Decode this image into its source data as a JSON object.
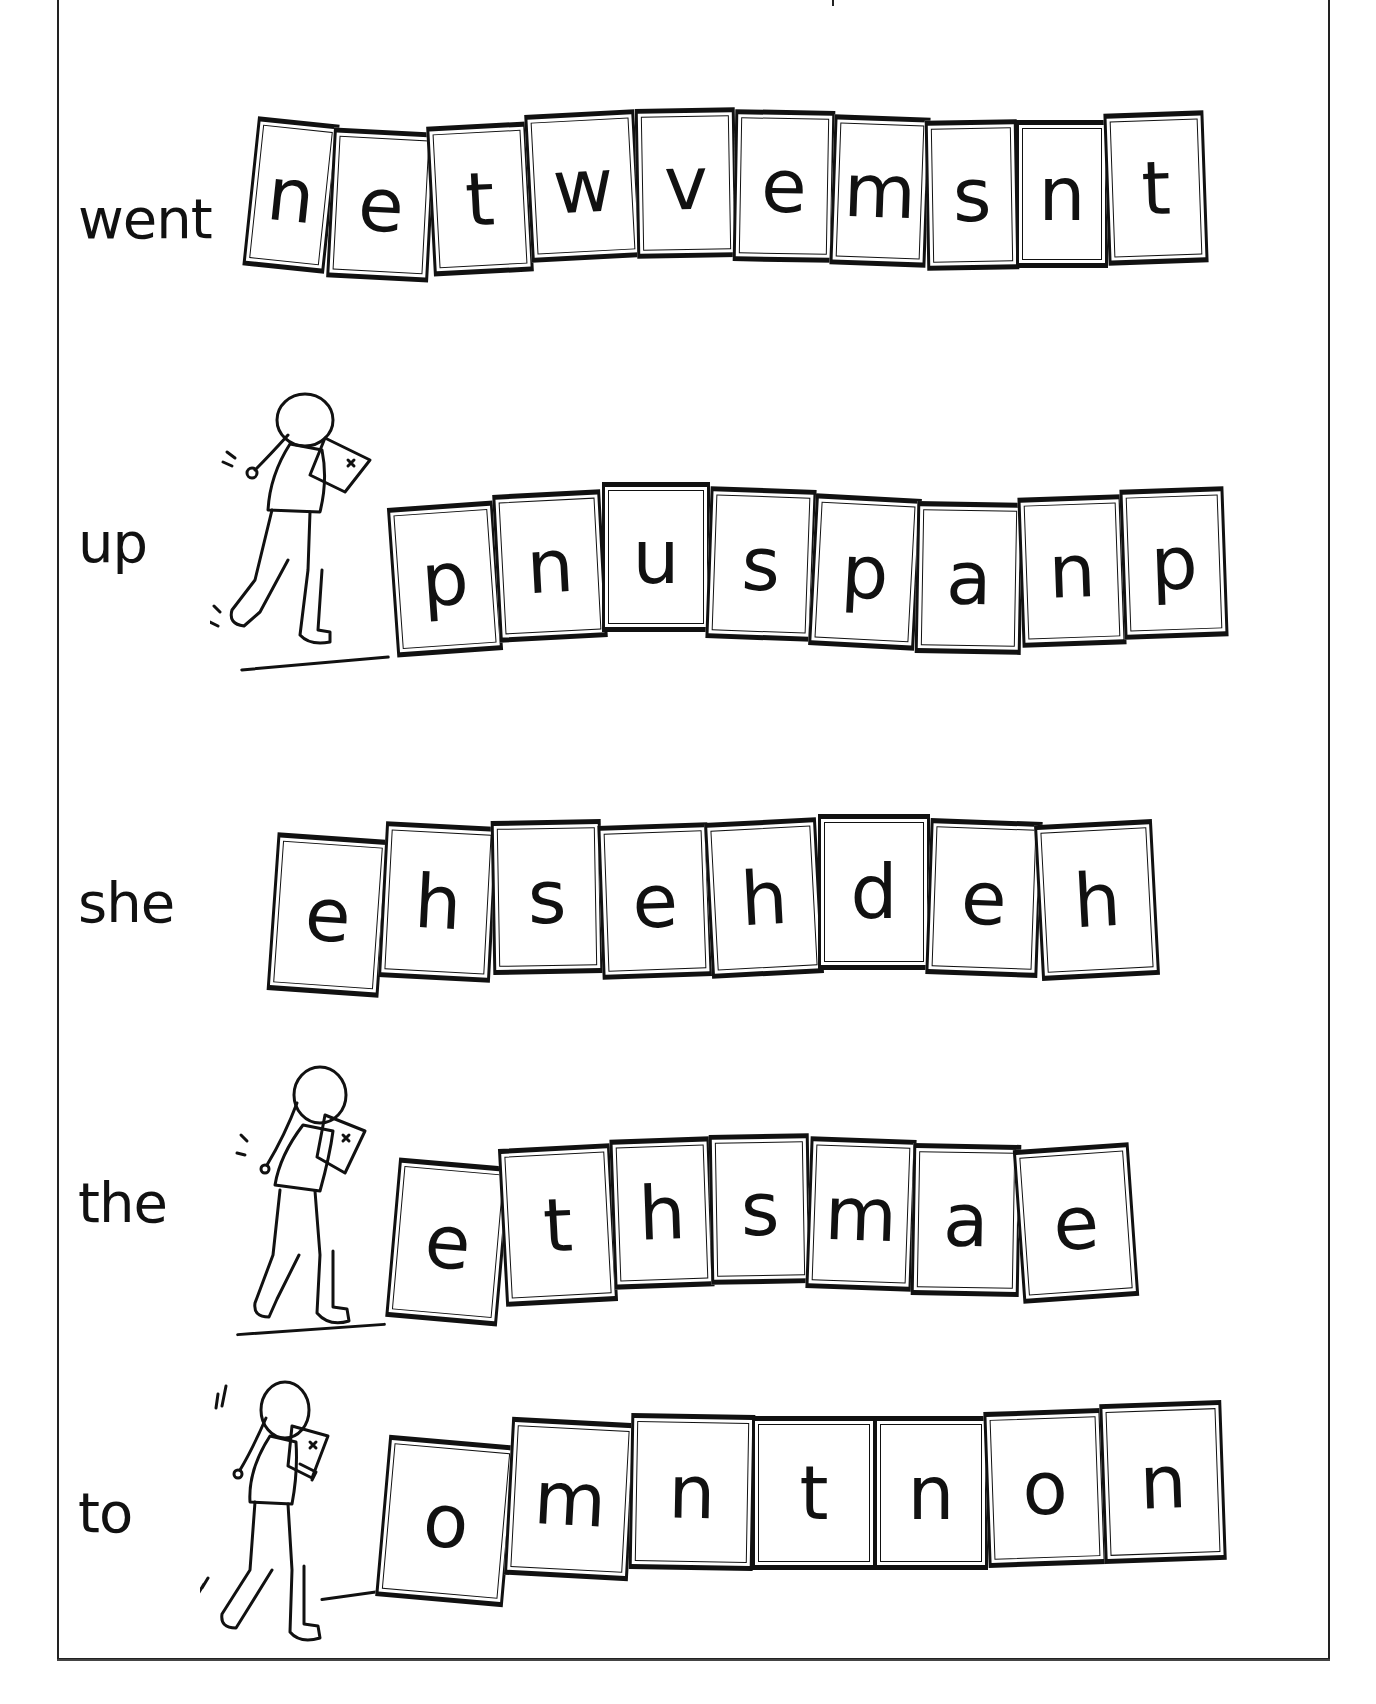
{
  "worksheet": {
    "rows": [
      {
        "word": "went",
        "letters": [
          "n",
          "e",
          "t",
          "w",
          "v",
          "e",
          "m",
          "s",
          "n",
          "t"
        ],
        "has_girl": false
      },
      {
        "word": "up",
        "letters": [
          "p",
          "n",
          "u",
          "s",
          "p",
          "a",
          "n",
          "p"
        ],
        "has_girl": true
      },
      {
        "word": "she",
        "letters": [
          "e",
          "h",
          "s",
          "e",
          "h",
          "d",
          "e",
          "h"
        ],
        "has_girl": false
      },
      {
        "word": "the",
        "letters": [
          "e",
          "t",
          "h",
          "s",
          "m",
          "a",
          "e"
        ],
        "has_girl": true
      },
      {
        "word": "to",
        "letters": [
          "o",
          "m",
          "n",
          "t",
          "n",
          "o",
          "n"
        ],
        "has_girl": true
      }
    ]
  },
  "icons": {
    "girl": "girl-with-map-icon"
  },
  "colors": {
    "ink": "#111111",
    "paper": "#ffffff",
    "frame": "#222222"
  }
}
